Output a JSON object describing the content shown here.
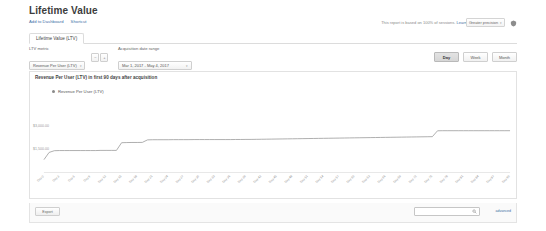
{
  "header": {
    "title": "Lifetime Value",
    "actions": [
      {
        "label": "Add to Dashboard"
      },
      {
        "label": "Shortcut"
      }
    ],
    "sampling_note": "This report is based on 100% of sessions.",
    "sampling_learn_more": "Learn more",
    "precision_value": "Greater precision",
    "shield_icon": "shield-icon"
  },
  "tabs": [
    {
      "label": "Lifetime Value (LTV)",
      "selected": true
    }
  ],
  "controls": {
    "metric_label": "LTV metric",
    "metric_value": "Revenue Per User (LTV)",
    "metric_minus": "−",
    "metric_plus": "+",
    "date_label": "Acquisition date range",
    "date_value": "Mar 1, 2017 - May 4, 2017",
    "caret": "▾",
    "granularity": [
      {
        "label": "Day",
        "selected": true
      },
      {
        "label": "Week",
        "selected": false
      },
      {
        "label": "Month",
        "selected": false
      }
    ]
  },
  "chart_panel": {
    "heading": "Revenue Per User (LTV) in first 90 days after acquisition",
    "legend_label": "Revenue Per User (LTV)"
  },
  "footer": {
    "button_label": "Export",
    "search_placeholder": "",
    "search_value": "",
    "search_icon": "search-icon",
    "advanced_label": "advanced"
  },
  "chart_data": {
    "type": "line",
    "title": "Revenue Per User (LTV) in first 90 days after acquisition",
    "xlabel": "",
    "ylabel": "",
    "series_name": "Revenue Per User (LTV)",
    "line_color": "#9a9a9a",
    "grid": false,
    "legend_position": "top-left",
    "ylim": [
      0,
      4500
    ],
    "yticks": [
      3000,
      1500
    ],
    "ytick_labels": [
      "$3,000.00",
      "$1,500.00"
    ],
    "x": [
      "Day 0",
      "Day 1",
      "Day 2",
      "Day 3",
      "Day 4",
      "Day 5",
      "Day 6",
      "Day 7",
      "Day 8",
      "Day 9",
      "Day 10",
      "Day 11",
      "Day 12",
      "Day 13",
      "Day 14",
      "Day 15",
      "Day 16",
      "Day 17",
      "Day 18",
      "Day 19",
      "Day 20",
      "Day 21",
      "Day 22",
      "Day 23",
      "Day 24",
      "Day 25",
      "Day 26",
      "Day 27",
      "Day 28",
      "Day 29",
      "Day 30",
      "Day 31",
      "Day 32",
      "Day 33",
      "Day 34",
      "Day 35",
      "Day 36",
      "Day 37",
      "Day 38",
      "Day 39",
      "Day 40",
      "Day 41",
      "Day 42",
      "Day 43",
      "Day 44",
      "Day 45",
      "Day 46",
      "Day 47",
      "Day 48",
      "Day 49",
      "Day 50",
      "Day 51",
      "Day 52",
      "Day 53",
      "Day 54",
      "Day 55",
      "Day 56",
      "Day 57",
      "Day 58",
      "Day 59",
      "Day 60",
      "Day 61",
      "Day 62",
      "Day 63",
      "Day 64",
      "Day 65",
      "Day 66",
      "Day 67",
      "Day 68",
      "Day 69",
      "Day 70",
      "Day 71",
      "Day 72",
      "Day 73",
      "Day 74",
      "Day 75",
      "Day 76",
      "Day 77",
      "Day 78",
      "Day 79",
      "Day 80",
      "Day 81",
      "Day 82",
      "Day 83",
      "Day 84",
      "Day 85",
      "Day 86",
      "Day 87",
      "Day 88",
      "Day 89",
      "Day 90"
    ],
    "xtick_labels": [
      "Day 0",
      "Day 3",
      "Day 6",
      "Day 9",
      "Day 12",
      "Day 15",
      "Day 18",
      "Day 21",
      "Day 24",
      "Day 27",
      "Day 30",
      "Day 33",
      "Day 36",
      "Day 39",
      "Day 42",
      "Day 45",
      "Day 48",
      "Day 51",
      "Day 54",
      "Day 57",
      "Day 60",
      "Day 63",
      "Day 66",
      "Day 69",
      "Day 72",
      "Day 75",
      "Day 78",
      "Day 81",
      "Day 84",
      "Day 87",
      "Day 90"
    ],
    "values": [
      820,
      1280,
      1390,
      1400,
      1400,
      1400,
      1400,
      1400,
      1400,
      1400,
      1400,
      1410,
      1410,
      1410,
      1410,
      1900,
      1910,
      1915,
      1915,
      1920,
      2080,
      2090,
      2090,
      2090,
      2090,
      2095,
      2095,
      2095,
      2095,
      2100,
      2100,
      2100,
      2100,
      2100,
      2100,
      2100,
      2100,
      2105,
      2105,
      2110,
      2110,
      2115,
      2120,
      2125,
      2130,
      2135,
      2140,
      2145,
      2150,
      2155,
      2160,
      2165,
      2170,
      2175,
      2180,
      2185,
      2190,
      2195,
      2200,
      2205,
      2210,
      2215,
      2220,
      2225,
      2230,
      2235,
      2240,
      2245,
      2250,
      2255,
      2260,
      2265,
      2270,
      2275,
      2280,
      2285,
      2660,
      2665,
      2665,
      2665,
      2665,
      2665,
      2665,
      2665,
      2665,
      2665,
      2665,
      2665,
      2665,
      2665,
      2665
    ]
  }
}
